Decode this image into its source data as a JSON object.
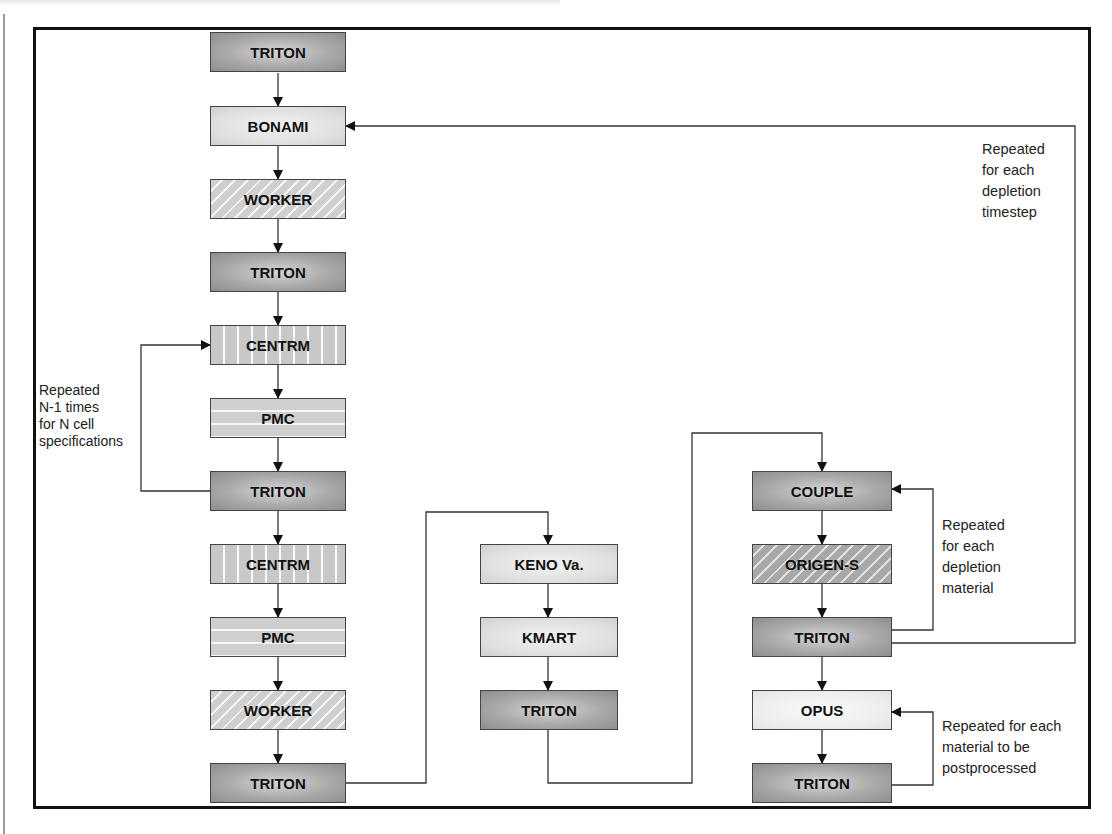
{
  "diagram": {
    "type": "flowchart",
    "column_left": {
      "nodes": [
        {
          "id": "n1",
          "label": "TRITON",
          "style": "dark"
        },
        {
          "id": "n2",
          "label": "BONAMI",
          "style": "light"
        },
        {
          "id": "n3",
          "label": "WORKER",
          "style": "diag"
        },
        {
          "id": "n4",
          "label": "TRITON",
          "style": "dark"
        },
        {
          "id": "n5",
          "label": "CENTRM",
          "style": "vert"
        },
        {
          "id": "n6",
          "label": "PMC",
          "style": "horiz"
        },
        {
          "id": "n7",
          "label": "TRITON",
          "style": "dark"
        },
        {
          "id": "n8",
          "label": "CENTRM",
          "style": "vert"
        },
        {
          "id": "n9",
          "label": "PMC",
          "style": "horiz"
        },
        {
          "id": "n10",
          "label": "WORKER",
          "style": "diag"
        },
        {
          "id": "n11",
          "label": "TRITON",
          "style": "dark"
        }
      ]
    },
    "column_middle": {
      "nodes": [
        {
          "id": "m1",
          "label": "KENO Va.",
          "style": "light"
        },
        {
          "id": "m2",
          "label": "KMART",
          "style": "light"
        },
        {
          "id": "m3",
          "label": "TRITON",
          "style": "dark"
        }
      ]
    },
    "column_right": {
      "nodes": [
        {
          "id": "r1",
          "label": "COUPLE",
          "style": "dark"
        },
        {
          "id": "r2",
          "label": "ORIGEN-S",
          "style": "diagdark"
        },
        {
          "id": "r3",
          "label": "TRITON",
          "style": "dark"
        },
        {
          "id": "r4",
          "label": "OPUS",
          "style": "lighter"
        },
        {
          "id": "r5",
          "label": "TRITON",
          "style": "dark"
        }
      ]
    },
    "notes": {
      "cell_loop": [
        "Repeated",
        "N-1 times",
        "for N cell",
        "specifications"
      ],
      "timestep_loop": [
        "Repeated",
        "for each",
        "depletion",
        "timestep"
      ],
      "material_loop": [
        "Repeated",
        "for each",
        "depletion",
        "material"
      ],
      "postprocess_loop": [
        "Repeated for each",
        "material to be",
        "postprocessed"
      ]
    },
    "edges": [
      [
        "n1",
        "n2"
      ],
      [
        "n2",
        "n3"
      ],
      [
        "n3",
        "n4"
      ],
      [
        "n4",
        "n5"
      ],
      [
        "n5",
        "n6"
      ],
      [
        "n6",
        "n7"
      ],
      [
        "n7",
        "n5",
        "loop: cell"
      ],
      [
        "n7",
        "n8"
      ],
      [
        "n8",
        "n9"
      ],
      [
        "n9",
        "n10"
      ],
      [
        "n10",
        "n11"
      ],
      [
        "n11",
        "m1"
      ],
      [
        "m1",
        "m2"
      ],
      [
        "m2",
        "m3"
      ],
      [
        "m3",
        "r1"
      ],
      [
        "r1",
        "r2"
      ],
      [
        "r2",
        "r3"
      ],
      [
        "r3",
        "r1",
        "loop: material"
      ],
      [
        "r3",
        "n2",
        "loop: timestep"
      ],
      [
        "r3",
        "r4"
      ],
      [
        "r4",
        "r5"
      ],
      [
        "r5",
        "r4",
        "loop: postprocess"
      ]
    ]
  }
}
